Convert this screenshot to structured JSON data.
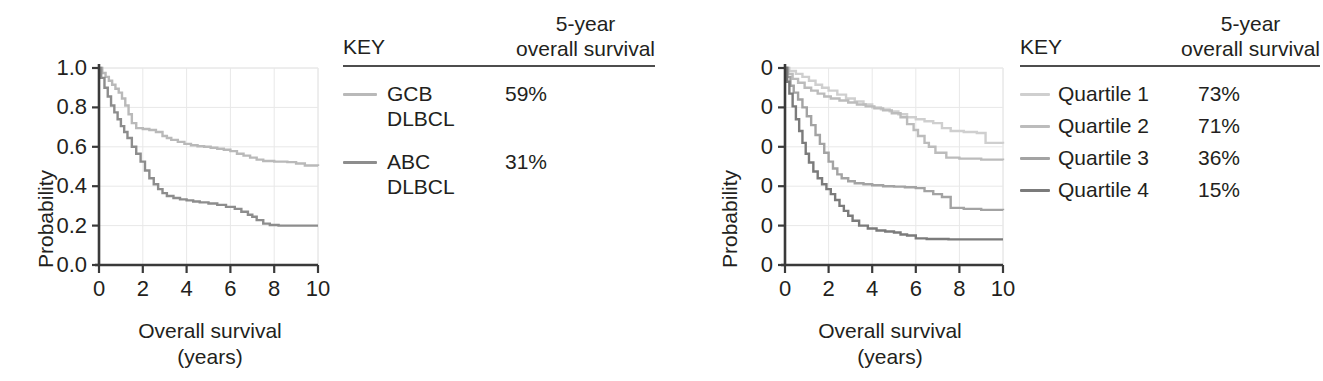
{
  "figure": {
    "background": "#ffffff",
    "text_color": "#231f20",
    "axis_color": "#3a3a3a",
    "grid_color": "#e8e8e8",
    "rule_color": "#4d4d4d"
  },
  "panels": [
    {
      "id": "left",
      "chart_ref": 0,
      "key": {
        "title": "KEY",
        "metric_line1": "5-year",
        "metric_line2": "overall survival",
        "rows": [
          {
            "label": "GCB\nDLBCL",
            "value": "59%",
            "color": "#b9b9b9"
          },
          {
            "label": "ABC\nDLBCL",
            "value": "31%",
            "color": "#8d8d8d"
          }
        ]
      }
    },
    {
      "id": "right",
      "chart_ref": 1,
      "key": {
        "title": "KEY",
        "metric_line1": "5-year",
        "metric_line2": "overall survival",
        "rows": [
          {
            "label": "Quartile 1",
            "value": "73%",
            "color": "#cfcfcf"
          },
          {
            "label": "Quartile 2",
            "value": "71%",
            "color": "#bcbcbc"
          },
          {
            "label": "Quartile 3",
            "value": "36%",
            "color": "#a3a3a3"
          },
          {
            "label": "Quartile 4",
            "value": "15%",
            "color": "#7b7b7b"
          }
        ]
      }
    }
  ],
  "chart_data": [
    {
      "type": "line",
      "subtype": "kaplan-meier-step",
      "title": "",
      "xlabel": "Overall survival\n(years)",
      "xlabel_line1": "Overall survival",
      "xlabel_line2": "(years)",
      "ylabel": "Probability",
      "xlim": [
        0,
        10
      ],
      "ylim": [
        0,
        1.0
      ],
      "xticks": [
        0,
        2,
        4,
        6,
        8,
        10
      ],
      "xticklabels": [
        "0",
        "2",
        "4",
        "6",
        "8",
        "10"
      ],
      "yticks": [
        0.0,
        0.2,
        0.4,
        0.6,
        0.8,
        1.0
      ],
      "yticklabels": [
        "0.0",
        "0.2",
        "0.4",
        "0.6",
        "0.8",
        "1.0"
      ],
      "grid": true,
      "legend_position": "external-right",
      "series": [
        {
          "name": "GCB DLBCL",
          "color": "#b9b9b9",
          "five_year_survival": "59%",
          "x": [
            0,
            0.15,
            0.3,
            0.45,
            0.6,
            0.75,
            0.9,
            1.05,
            1.2,
            1.35,
            1.5,
            1.7,
            2.0,
            2.3,
            2.6,
            2.9,
            3.1,
            3.3,
            3.6,
            3.9,
            4.2,
            4.5,
            4.8,
            5.1,
            5.4,
            5.7,
            6.0,
            6.3,
            6.6,
            6.9,
            7.2,
            7.5,
            8.0,
            8.6,
            9.0,
            9.4,
            10
          ],
          "y": [
            1.0,
            0.975,
            0.955,
            0.935,
            0.915,
            0.895,
            0.875,
            0.845,
            0.81,
            0.765,
            0.72,
            0.695,
            0.69,
            0.685,
            0.675,
            0.655,
            0.645,
            0.635,
            0.625,
            0.615,
            0.608,
            0.603,
            0.6,
            0.595,
            0.59,
            0.585,
            0.578,
            0.565,
            0.555,
            0.545,
            0.535,
            0.528,
            0.525,
            0.522,
            0.515,
            0.505,
            0.502
          ]
        },
        {
          "name": "ABC DLBCL",
          "color": "#8d8d8d",
          "five_year_survival": "31%",
          "x": [
            0,
            0.1,
            0.25,
            0.4,
            0.55,
            0.7,
            0.85,
            1.0,
            1.15,
            1.3,
            1.5,
            1.7,
            1.9,
            2.1,
            2.3,
            2.5,
            2.7,
            2.9,
            3.1,
            3.4,
            3.7,
            4.0,
            4.3,
            4.6,
            5.0,
            5.4,
            5.8,
            6.2,
            6.5,
            6.8,
            7.0,
            7.2,
            7.5,
            7.8,
            8.2,
            9.0,
            10
          ],
          "y": [
            1.0,
            0.95,
            0.9,
            0.855,
            0.81,
            0.775,
            0.74,
            0.705,
            0.675,
            0.645,
            0.6,
            0.565,
            0.525,
            0.48,
            0.44,
            0.41,
            0.385,
            0.365,
            0.35,
            0.34,
            0.333,
            0.328,
            0.322,
            0.318,
            0.312,
            0.305,
            0.295,
            0.285,
            0.27,
            0.255,
            0.245,
            0.228,
            0.21,
            0.203,
            0.2,
            0.2,
            0.2
          ]
        }
      ]
    },
    {
      "type": "line",
      "subtype": "kaplan-meier-step",
      "title": "",
      "xlabel": "Overall survival\n(years)",
      "xlabel_line1": "Overall survival",
      "xlabel_line2": "(years)",
      "ylabel": "Probability",
      "xlim": [
        0,
        10
      ],
      "ylim": [
        0,
        1.0
      ],
      "xticks": [
        0,
        2,
        4,
        6,
        8,
        10
      ],
      "xticklabels": [
        "0",
        "2",
        "4",
        "6",
        "8",
        "10"
      ],
      "yticks": [
        0.0,
        0.2,
        0.4,
        0.6,
        0.8,
        1.0
      ],
      "yticklabels": [
        "0",
        "0",
        "0",
        "0",
        "0",
        "0"
      ],
      "ytick_note": "y-axis numerals cropped at image edge; only trailing 0 visible",
      "grid": true,
      "legend_position": "external-right",
      "series": [
        {
          "name": "Quartile 1",
          "color": "#cfcfcf",
          "five_year_survival": "73%",
          "x": [
            0,
            0.2,
            0.5,
            0.8,
            1.1,
            1.4,
            1.7,
            2.0,
            2.4,
            2.8,
            3.2,
            3.6,
            4.0,
            4.4,
            4.8,
            5.2,
            5.6,
            6.0,
            6.4,
            6.8,
            7.2,
            7.6,
            8.2,
            8.8,
            9.2,
            10
          ],
          "y": [
            1.0,
            0.985,
            0.97,
            0.955,
            0.935,
            0.915,
            0.9,
            0.885,
            0.865,
            0.845,
            0.83,
            0.815,
            0.8,
            0.79,
            0.78,
            0.765,
            0.75,
            0.74,
            0.73,
            0.72,
            0.695,
            0.68,
            0.675,
            0.67,
            0.62,
            0.615
          ]
        },
        {
          "name": "Quartile 2",
          "color": "#bcbcbc",
          "five_year_survival": "71%",
          "x": [
            0,
            0.15,
            0.35,
            0.6,
            0.9,
            1.2,
            1.5,
            1.8,
            2.1,
            2.5,
            2.9,
            3.3,
            3.7,
            4.1,
            4.5,
            4.9,
            5.3,
            5.6,
            5.9,
            6.1,
            6.4,
            6.6,
            6.9,
            7.4,
            8.0,
            9.0,
            10
          ],
          "y": [
            1.0,
            0.97,
            0.945,
            0.925,
            0.9,
            0.885,
            0.87,
            0.855,
            0.845,
            0.835,
            0.825,
            0.815,
            0.805,
            0.795,
            0.785,
            0.77,
            0.75,
            0.715,
            0.685,
            0.655,
            0.62,
            0.6,
            0.57,
            0.545,
            0.54,
            0.535,
            0.532
          ]
        },
        {
          "name": "Quartile 3",
          "color": "#a3a3a3",
          "five_year_survival": "36%",
          "x": [
            0,
            0.1,
            0.25,
            0.4,
            0.6,
            0.8,
            1.0,
            1.2,
            1.4,
            1.6,
            1.8,
            2.0,
            2.2,
            2.4,
            2.6,
            2.9,
            3.2,
            3.6,
            4.0,
            4.5,
            5.0,
            5.5,
            6.0,
            6.4,
            6.8,
            7.2,
            7.6,
            8.2,
            9.0,
            10
          ],
          "y": [
            1.0,
            0.955,
            0.91,
            0.875,
            0.84,
            0.8,
            0.755,
            0.71,
            0.66,
            0.615,
            0.57,
            0.525,
            0.49,
            0.46,
            0.44,
            0.425,
            0.415,
            0.41,
            0.405,
            0.4,
            0.398,
            0.395,
            0.39,
            0.375,
            0.36,
            0.345,
            0.29,
            0.285,
            0.28,
            0.278
          ]
        },
        {
          "name": "Quartile 4",
          "color": "#7b7b7b",
          "five_year_survival": "15%",
          "x": [
            0,
            0.1,
            0.2,
            0.35,
            0.5,
            0.65,
            0.8,
            0.95,
            1.1,
            1.3,
            1.5,
            1.7,
            1.9,
            2.1,
            2.3,
            2.5,
            2.7,
            2.9,
            3.1,
            3.4,
            3.8,
            4.2,
            4.6,
            5.0,
            5.3,
            5.6,
            6.0,
            6.5,
            7.5,
            8.5,
            10
          ],
          "y": [
            1.0,
            0.93,
            0.87,
            0.805,
            0.74,
            0.68,
            0.62,
            0.565,
            0.52,
            0.475,
            0.44,
            0.41,
            0.385,
            0.36,
            0.33,
            0.3,
            0.275,
            0.25,
            0.225,
            0.2,
            0.185,
            0.175,
            0.17,
            0.165,
            0.155,
            0.15,
            0.135,
            0.132,
            0.13,
            0.13,
            0.13
          ]
        }
      ]
    }
  ]
}
